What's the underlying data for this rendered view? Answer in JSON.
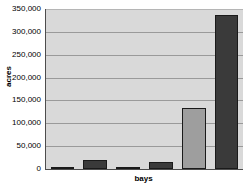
{
  "chart_data": {
    "type": "bar",
    "title": "",
    "xlabel": "bays",
    "ylabel": "acres",
    "grid": true,
    "legend": false,
    "categories": [
      "1",
      "2",
      "3",
      "4",
      "5",
      "6"
    ],
    "values": [
      3000,
      19000,
      3000,
      15000,
      134000,
      337000
    ],
    "ylim": [
      0,
      350000
    ],
    "ytick_labels": [
      "350,000",
      "300,000",
      "250,000",
      "200,000",
      "150,000",
      "100,000",
      "50,000",
      "0"
    ],
    "ytick_values": [
      350000,
      300000,
      250000,
      200000,
      150000,
      100000,
      50000,
      0
    ],
    "bar_colors": [
      "#4d4d4d",
      "#3a3a3a",
      "#4d4d4d",
      "#3a3a3a",
      "#9e9e9e",
      "#3a3a3a"
    ],
    "plot_background": "#d9d9d9",
    "gridline_color": "#9a9a9a",
    "axis_color": "#4d4d4d"
  }
}
